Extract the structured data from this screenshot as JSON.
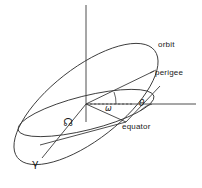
{
  "figure": {
    "background_color": "#ffffff",
    "line_color": "#3a3a3a",
    "text_color": "#1a1a1a",
    "width": 202,
    "height": 188
  },
  "labels": {
    "orbit": "orbit",
    "perigee": "perigee",
    "equator": "equator",
    "argument_of_perigee_symbol": "ω",
    "true_anomaly_symbol": "θ",
    "ascending_node_symbol": "☊",
    "vernal_equinox_symbol": "γ"
  },
  "elements": {
    "polar_axis": "vertical-axis",
    "reference_line": "horizontal-reference-line",
    "orbit_ellipse": "inclined-orbit-ellipse",
    "equator_ellipse": "equatorial-plane-ellipse",
    "perigee_radius": "center-to-perigee-line",
    "node_line": "center-to-ascending-node-line",
    "equinox_line": "center-to-vernal-equinox-line",
    "omega_arc": "argument-of-perigee-arc",
    "theta_arc": "true-anomaly-arc"
  }
}
